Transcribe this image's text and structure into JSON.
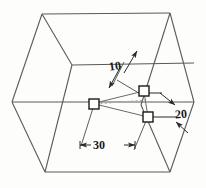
{
  "figure": {
    "type": "isometric-technical-drawing",
    "background_color": "#fdfdfc",
    "line_color": "#4a4a4a",
    "dimension_line_color": "#2a2a2a",
    "hidden_line_color": "#9a9a9a",
    "marker_fill": "#ffffff"
  },
  "dimensions": [
    {
      "id": "dim-10",
      "value": "10",
      "orientation": "diagonal-up-right",
      "arrow_style": "double-outward"
    },
    {
      "id": "dim-20",
      "value": "20",
      "orientation": "diagonal-down-right",
      "arrow_style": "double-outward"
    },
    {
      "id": "dim-30",
      "value": "30",
      "orientation": "horizontal",
      "arrow_style": "double-inward"
    }
  ],
  "markers": [
    {
      "id": "marker-left",
      "x": 94,
      "y": 104
    },
    {
      "id": "marker-upper-right",
      "x": 144,
      "y": 91
    },
    {
      "id": "marker-lower-right",
      "x": 148,
      "y": 117
    }
  ],
  "box": {
    "outline_vertices": [
      [
        42,
        14
      ],
      [
        170,
        13
      ],
      [
        194,
        102
      ],
      [
        170,
        172
      ],
      [
        45,
        172
      ],
      [
        12,
        102
      ]
    ],
    "front_face_top_y": 65,
    "mid_horizontal_y": 102
  }
}
